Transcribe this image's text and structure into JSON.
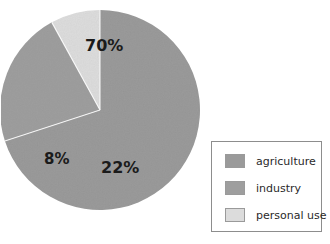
{
  "chart_data": {
    "type": "pie",
    "title": "",
    "labels": [
      "agriculture",
      "industry",
      "personal use"
    ],
    "values": [
      70,
      22,
      8
    ],
    "value_labels": [
      "70%",
      "22%",
      "8%"
    ],
    "unit": "%",
    "total": 100,
    "legend_position": "right",
    "grid": false,
    "colors": [
      "#9a9a9a",
      "#9e9e9e",
      "#dcdcdc"
    ],
    "slices": [
      {
        "label": "agriculture",
        "value": 70,
        "display": "70%",
        "color": "#9a9a9a",
        "start_deg": 0,
        "end_deg": 252
      },
      {
        "label": "industry",
        "value": 22,
        "display": "22%",
        "color": "#9e9e9e",
        "start_deg": 252,
        "end_deg": 331.2
      },
      {
        "label": "personal use",
        "value": 8,
        "display": "8%",
        "color": "#dcdcdc",
        "start_deg": 331.2,
        "end_deg": 360
      }
    ]
  },
  "pie": {
    "label_70": "70%",
    "label_22": "22%",
    "label_8": "8%"
  },
  "legend": {
    "items": [
      {
        "label": "agriculture",
        "color": "#9a9a9a"
      },
      {
        "label": "industry",
        "color": "#9e9e9e"
      },
      {
        "label": "personal use",
        "color": "#dcdcdc"
      }
    ]
  },
  "colors": {
    "background": "#ffffff",
    "slice_primary": "#9a9a9a",
    "slice_secondary": "#9e9e9e",
    "slice_light": "#dcdcdc",
    "legend_border": "#8d8d8d",
    "label_text": "#1b1b1b",
    "legend_text": "#2a2a2a"
  }
}
